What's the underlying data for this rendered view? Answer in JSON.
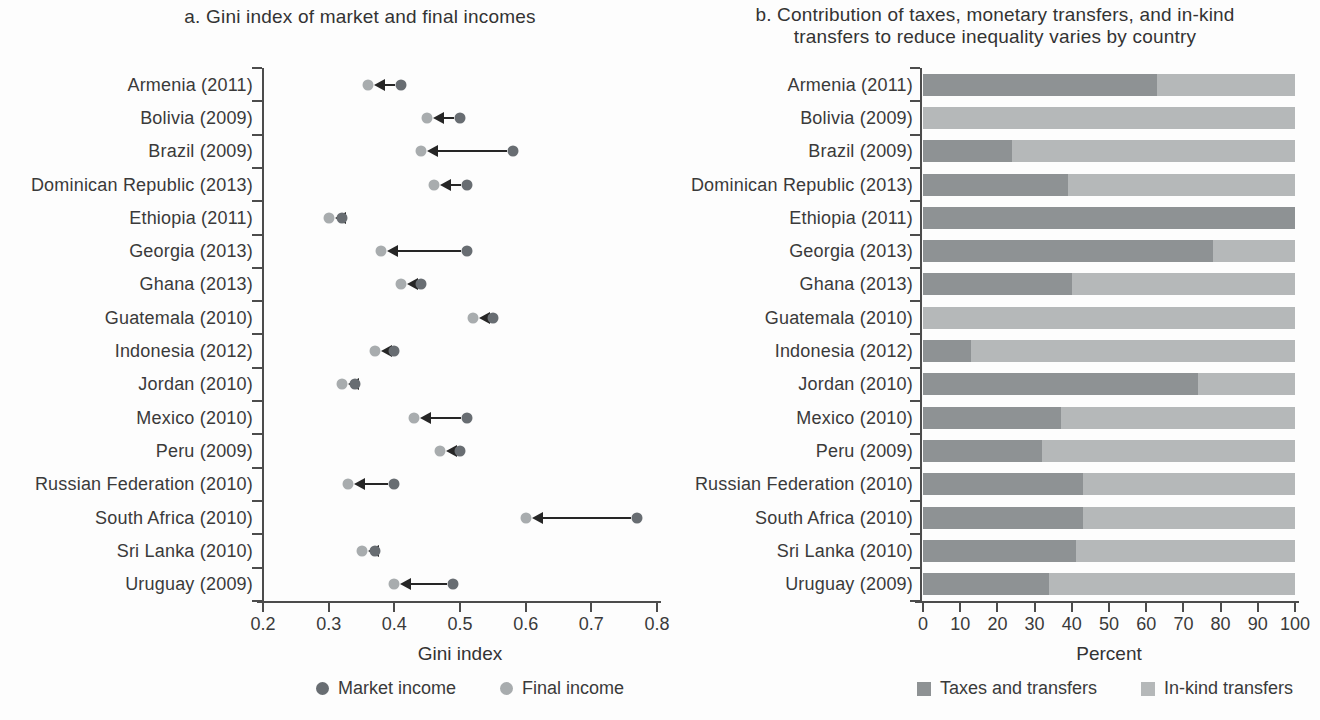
{
  "colors": {
    "market_dot": "#686d72",
    "final_dot": "#a8acae",
    "arrow": "#262626",
    "taxes_bar": "#8e9294",
    "inkind_bar": "#b5b8b9",
    "axis": "#4c4c4c",
    "text": "#3a3a3a"
  },
  "chart_data": [
    {
      "type": "scatter",
      "title": "a. Gini index of market and final incomes",
      "xlabel": "Gini index",
      "xlim": [
        0.2,
        0.8
      ],
      "xtick_labels": [
        "0.2",
        "0.3",
        "0.4",
        "0.5",
        "0.6",
        "0.7",
        "0.8"
      ],
      "legend": [
        "Market income",
        "Final income"
      ],
      "categories": [
        "Armenia (2011)",
        "Bolivia (2009)",
        "Brazil (2009)",
        "Dominican Republic (2013)",
        "Ethiopia (2011)",
        "Georgia (2013)",
        "Ghana (2013)",
        "Guatemala (2010)",
        "Indonesia (2012)",
        "Jordan (2010)",
        "Mexico (2010)",
        "Peru (2009)",
        "Russian Federation (2010)",
        "South Africa (2010)",
        "Sri Lanka (2010)",
        "Uruguay (2009)"
      ],
      "series": [
        {
          "name": "Market income",
          "values": [
            0.41,
            0.5,
            0.58,
            0.51,
            0.32,
            0.51,
            0.44,
            0.55,
            0.4,
            0.34,
            0.51,
            0.5,
            0.4,
            0.77,
            0.37,
            0.49
          ]
        },
        {
          "name": "Final income",
          "values": [
            0.36,
            0.45,
            0.44,
            0.46,
            0.3,
            0.38,
            0.41,
            0.52,
            0.37,
            0.32,
            0.43,
            0.47,
            0.33,
            0.6,
            0.35,
            0.4
          ]
        }
      ]
    },
    {
      "type": "bar",
      "title": "b. Contribution of taxes, monetary transfers, and in-kind transfers to reduce inequality varies by country",
      "title_lines": [
        "b. Contribution of taxes, monetary transfers, and in-kind",
        "transfers to reduce inequality varies by country"
      ],
      "xlabel": "Percent",
      "xlim": [
        0,
        100
      ],
      "xtick_labels": [
        "0",
        "10",
        "20",
        "30",
        "40",
        "50",
        "60",
        "70",
        "80",
        "90",
        "100"
      ],
      "legend": [
        "Taxes and transfers",
        "In-kind transfers"
      ],
      "categories": [
        "Armenia (2011)",
        "Bolivia (2009)",
        "Brazil (2009)",
        "Dominican Republic (2013)",
        "Ethiopia (2011)",
        "Georgia (2013)",
        "Ghana (2013)",
        "Guatemala (2010)",
        "Indonesia (2012)",
        "Jordan (2010)",
        "Mexico (2010)",
        "Peru (2009)",
        "Russian Federation (2010)",
        "South Africa (2010)",
        "Sri Lanka (2010)",
        "Uruguay (2009)"
      ],
      "series": [
        {
          "name": "Taxes and transfers",
          "values": [
            63,
            0,
            24,
            39,
            100,
            78,
            40,
            0,
            13,
            74,
            37,
            32,
            43,
            43,
            41,
            34
          ]
        },
        {
          "name": "In-kind transfers",
          "values": [
            37,
            100,
            76,
            61,
            0,
            22,
            60,
            100,
            87,
            26,
            63,
            68,
            57,
            57,
            59,
            66
          ]
        }
      ]
    }
  ]
}
